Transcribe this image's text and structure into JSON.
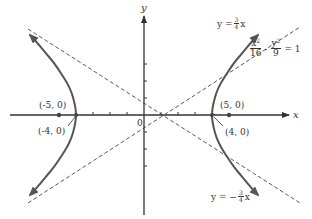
{
  "diagram": {
    "axes": {
      "x_label": "x",
      "y_label": "y",
      "origin_label": "0"
    },
    "points": [
      {
        "id": "focus-left",
        "label": "(-5, 0)"
      },
      {
        "id": "vertex-left",
        "label": "(-4, 0)"
      },
      {
        "id": "focus-right",
        "label": "(5, 0)"
      },
      {
        "id": "vertex-right",
        "label": "(4, 0)"
      }
    ],
    "equation": {
      "lhs_num1": "x",
      "lhs_den1": "16",
      "minus": "-",
      "lhs_num2": "y",
      "lhs_den2": "9",
      "rhs": "= 1",
      "exp": "2"
    },
    "asymptote_upper": {
      "prefix": "y =",
      "num": "3",
      "den": "4",
      "suffix": "x"
    },
    "asymptote_lower": {
      "prefix": "y = −",
      "num": "3",
      "den": "4",
      "suffix": "x"
    },
    "colors": {
      "curve": "#555555",
      "axis": "#333333",
      "dashed": "#444444"
    }
  }
}
